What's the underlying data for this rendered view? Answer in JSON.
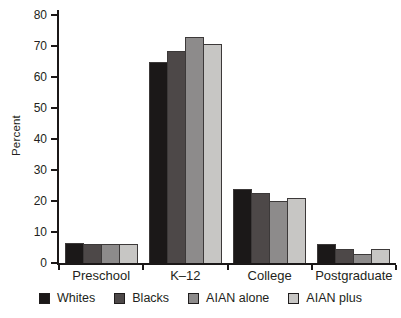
{
  "figure": {
    "background": "#ffffff",
    "text_color": "#231f20",
    "axis_color": "#1b1818",
    "bar_border_color": "#3c3939"
  },
  "chart_data": {
    "type": "bar",
    "title": "",
    "xlabel": "",
    "ylabel": "Percent",
    "categories": [
      "Preschool",
      "K–12",
      "College",
      "Postgraduate"
    ],
    "series": [
      {
        "name": "Whites",
        "color": "#1b1818",
        "values": [
          6.3,
          65,
          24,
          6
        ]
      },
      {
        "name": "Blacks",
        "color": "#4d4848",
        "values": [
          6,
          68.5,
          22.5,
          4.5
        ]
      },
      {
        "name": "AIAN alone",
        "color": "#8d8b8b",
        "values": [
          6,
          73,
          20,
          3
        ]
      },
      {
        "name": "AIAN plus",
        "color": "#c7c6c4",
        "values": [
          6,
          70.5,
          21,
          4.5
        ]
      }
    ],
    "ylim": [
      0,
      80
    ],
    "yticks": [
      0,
      10,
      20,
      30,
      40,
      50,
      60,
      70,
      80
    ],
    "grid": false,
    "legend_position": "bottom"
  }
}
